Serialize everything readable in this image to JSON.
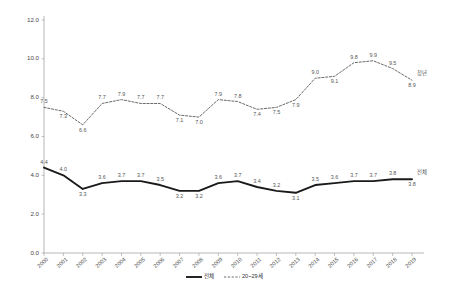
{
  "chart_data": {
    "type": "line",
    "title": "",
    "xlabel": "",
    "ylabel": "",
    "ylim": [
      0.0,
      12.0
    ],
    "ytick_labels": [
      "0.0",
      "2.0",
      "4.0",
      "6.0",
      "8.0",
      "10.0",
      "12.0"
    ],
    "ytick_values": [
      0.0,
      2.0,
      4.0,
      6.0,
      8.0,
      10.0,
      12.0
    ],
    "grid": false,
    "legend_position": "bottom-center",
    "categories": [
      "2000",
      "2001",
      "2002",
      "2003",
      "2004",
      "2005",
      "2006",
      "2007",
      "2008",
      "2009",
      "2010",
      "2011",
      "2012",
      "2013",
      "2014",
      "2015",
      "2016",
      "2017",
      "2018",
      "2019"
    ],
    "series": [
      {
        "name": "전체",
        "style": "solid",
        "color": "#1a1a1a",
        "end_label": "전체",
        "values": [
          4.4,
          4.0,
          3.3,
          3.6,
          3.7,
          3.7,
          3.5,
          3.2,
          3.2,
          3.6,
          3.7,
          3.4,
          3.2,
          3.1,
          3.5,
          3.6,
          3.7,
          3.7,
          3.8,
          3.8
        ],
        "value_labels": [
          "4.4",
          "4.0",
          "3.3",
          "3.6",
          "3.7",
          "3.7",
          "3.5",
          "3.2",
          "3.2",
          "3.6",
          "3.7",
          "3.4",
          "3.2",
          "3.1",
          "3.5",
          "3.6",
          "3.7",
          "3.7",
          "3.8",
          "3.8"
        ],
        "label_side": [
          "above",
          "above",
          "below",
          "above",
          "above",
          "above",
          "above",
          "below",
          "below",
          "above",
          "above",
          "above",
          "above",
          "below",
          "above",
          "above",
          "above",
          "above",
          "above",
          "below"
        ]
      },
      {
        "name": "20~29세",
        "style": "dotted",
        "color": "#6b6b6b",
        "end_label": "청년",
        "values": [
          7.5,
          7.3,
          6.6,
          7.7,
          7.9,
          7.7,
          7.7,
          7.1,
          7.0,
          7.9,
          7.8,
          7.4,
          7.5,
          7.9,
          9.0,
          9.1,
          9.8,
          9.9,
          9.5,
          8.9
        ],
        "value_labels": [
          "7.5",
          "7.3",
          "6.6",
          "7.7",
          "7.9",
          "7.7",
          "7.7",
          "7.1",
          "7.0",
          "7.9",
          "7.8",
          "7.4",
          "7.5",
          "7.9",
          "9.0",
          "9.1",
          "9.8",
          "9.9",
          "9.5",
          "8.9"
        ],
        "label_side": [
          "above",
          "below",
          "below",
          "above",
          "above",
          "above",
          "above",
          "below",
          "below",
          "above",
          "above",
          "below",
          "below",
          "below",
          "above",
          "below",
          "above",
          "above",
          "above",
          "below"
        ]
      }
    ],
    "legend": [
      {
        "label": "전체",
        "style": "solid"
      },
      {
        "label": "20~29세",
        "style": "dotted"
      }
    ]
  }
}
